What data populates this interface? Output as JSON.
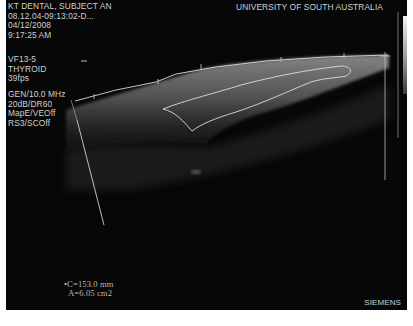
{
  "header": {
    "patient": "KT DENTAL, SUBJECT AN",
    "study_id": "08.12.04-09:13:02-D...",
    "date": "04/12/2008",
    "time": "9:17:25 AM",
    "institution": "UNIVERSITY OF SOUTH AUSTRALIA"
  },
  "probe": {
    "transducer": "VF13-5",
    "preset": "THYROID",
    "frame_rate": "39fps"
  },
  "params": {
    "frequency": "GEN/10.0 MHz",
    "gain_dr": "20dB/DR60",
    "map": "MapE/VEOff",
    "resolution": "RS3/SCOff"
  },
  "measurement": {
    "circumference": "•C=153.0 mm",
    "area": "A=6.05 cm2"
  },
  "brand": "SIEMENS",
  "colors": {
    "background": "#070707",
    "overlay_text": "#cfcfcf",
    "trace": "#d8d8d8"
  },
  "icons": {
    "grayscale_bar": "grayscale-bar",
    "depth_caliper": "depth-line",
    "trace_outline": "trace-outline"
  }
}
